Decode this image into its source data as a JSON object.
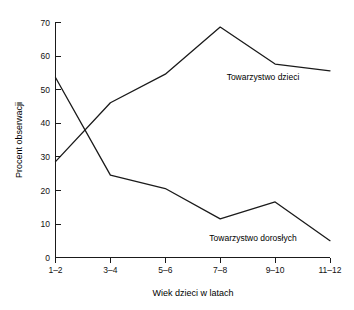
{
  "chart_data": {
    "type": "line",
    "title": "",
    "subtitle": "",
    "xlabel": "Wiek dzieci w latach",
    "ylabel": "Procent obserwacji",
    "categories": [
      "1–2",
      "3–4",
      "5–6",
      "7–8",
      "9–10",
      "11–12"
    ],
    "ylim": [
      0,
      70
    ],
    "yticks": [
      0,
      10,
      20,
      30,
      40,
      50,
      60,
      70
    ],
    "ytick_labels": [
      "0",
      "10",
      "20",
      "30",
      "40",
      "50",
      "60",
      "70"
    ],
    "grid": false,
    "legend_position": "inline-annotation",
    "series": [
      {
        "name": "Towarzystwo dzieci",
        "values": [
          28.5,
          46,
          54.5,
          68.5,
          57.5,
          55.5
        ],
        "color": "#1a1a1a"
      },
      {
        "name": "Towarzystwo dorosłych",
        "values": [
          53.5,
          24.5,
          20.5,
          11.5,
          16.5,
          5
        ],
        "color": "#1a1a1a"
      }
    ],
    "annotations": [
      {
        "text": "Towarzystwo dzieci",
        "series": "Towarzystwo dzieci",
        "x_px": 263,
        "y_px": 80
      },
      {
        "text": "Towarzystwo dorosłych",
        "series": "Towarzystwo dorosłych",
        "x_px": 253,
        "y_px": 241
      }
    ]
  },
  "axes": {
    "y_title": "Procent obserwacji",
    "x_title": "Wiek dzieci w latach",
    "y_ticks": [
      {
        "label": "70"
      },
      {
        "label": "60"
      },
      {
        "label": "50"
      },
      {
        "label": "40"
      },
      {
        "label": "30"
      },
      {
        "label": "20"
      },
      {
        "label": "10"
      },
      {
        "label": "0"
      }
    ],
    "x_ticks": [
      {
        "label": "1–2"
      },
      {
        "label": "3–4"
      },
      {
        "label": "5–6"
      },
      {
        "label": "7–8"
      },
      {
        "label": "9–10"
      },
      {
        "label": "11–12"
      }
    ]
  },
  "series_labels": {
    "children": "Towarzystwo dzieci",
    "adults": "Towarzystwo dorosłych"
  },
  "colors": {
    "line": "#1a1a1a",
    "axis": "#1a1a1a",
    "text": "#000000",
    "background": "#ffffff"
  }
}
